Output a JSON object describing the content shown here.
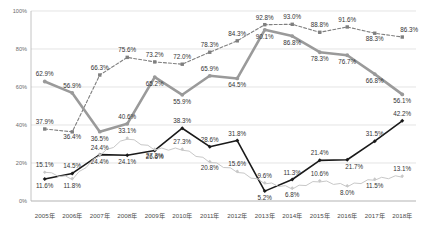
{
  "chart": {
    "title": "",
    "type": "line"
  },
  "axes": {
    "y_ticks": [
      "100%",
      "80%",
      "60%",
      "40%",
      "20%",
      "0%"
    ],
    "y_min": 0,
    "y_max": 100,
    "x_ticks": [
      "2005年",
      "2006年",
      "2007年",
      "2008年",
      "2009年",
      "2010年",
      "2011年",
      "2012年",
      "2013年",
      "2014年",
      "2015年",
      "2016年",
      "2017年",
      "2018年"
    ],
    "grid": true,
    "legend": "none"
  },
  "chart_data": {
    "type": "line",
    "title": "",
    "xlabel": "",
    "ylabel": "",
    "ylim": [
      0,
      100
    ],
    "grid": true,
    "legend_position": "none",
    "categories": [
      "2005年",
      "2006年",
      "2007年",
      "2008年",
      "2009年",
      "2010年",
      "2011年",
      "2012年",
      "2013年",
      "2014年",
      "2015年",
      "2016年",
      "2017年",
      "2018年"
    ],
    "series": [
      {
        "name": "series-gray-dashed",
        "style": "dashed-gray-square",
        "values": [
          37.9,
          36.4,
          66.3,
          75.6,
          73.2,
          72.0,
          78.3,
          84.3,
          92.8,
          93.0,
          88.8,
          91.6,
          88.3,
          86.3
        ],
        "labels": [
          "37.9%",
          "36.4%",
          "66.3%",
          "75.6%",
          "73.2%",
          "72.0%",
          "78.3%",
          "84.3%",
          "92.8%",
          "93.0%",
          "88.8%",
          "91.6%",
          "88.3%",
          "86.3%"
        ]
      },
      {
        "name": "series-gray-solid",
        "style": "solid-gray-thick",
        "values": [
          62.9,
          56.9,
          36.5,
          40.6,
          65.2,
          55.9,
          65.9,
          64.5,
          90.1,
          86.8,
          78.3,
          76.7,
          66.8,
          56.1
        ],
        "labels": [
          "62.9%",
          "56.9%",
          "36.5%",
          "40.6%",
          "65.2%",
          "55.9%",
          "65.9%",
          "64.5%",
          "90.1%",
          "86.8%",
          "78.3%",
          "76.7%",
          "66.8%",
          "56.1%"
        ]
      },
      {
        "name": "series-black-solid",
        "style": "solid-black-diamond",
        "values": [
          11.6,
          14.5,
          24.4,
          24.1,
          26.6,
          38.3,
          28.6,
          31.8,
          5.2,
          11.3,
          21.4,
          21.7,
          31.5,
          42.2
        ],
        "labels": [
          "11.6%",
          "14.5%",
          "24.4%",
          "24.1%",
          "26.6%",
          "38.3%",
          "28.6%",
          "31.8%",
          "5.2%",
          "11.3%",
          "21.4%",
          "21.7%",
          "31.5%",
          "42.2%"
        ]
      },
      {
        "name": "series-light-gray",
        "style": "thin-light-gray-diamond",
        "values": [
          15.1,
          11.8,
          24.4,
          33.1,
          27.3,
          27.3,
          20.8,
          15.6,
          9.6,
          6.8,
          10.6,
          8.0,
          11.5,
          13.1
        ],
        "labels": [
          "15.1%",
          "11.8%",
          "24.4%",
          "33.1%",
          "27.3%",
          "27.3%",
          "20.8%",
          "15.6%",
          "9.6%",
          "6.8%",
          "10.6%",
          "8.0%",
          "11.5%",
          "13.1%"
        ]
      }
    ],
    "point_labels_all": [
      "62.9%",
      "56.9%",
      "66.3%",
      "75.6%",
      "73.2%",
      "72.0%",
      "65.9%",
      "64.5%",
      "92.8%",
      "93.0%",
      "88.8%",
      "91.6%",
      "88.3%",
      "86.3%",
      "90.1%",
      "86.8%",
      "78.3%",
      "76.7%",
      "66.8%",
      "56.1%",
      "84.3%",
      "78.3%",
      "65.2%",
      "55.9%",
      "36.5%",
      "40.6%",
      "36.4%",
      "37.9%",
      "15.1%",
      "14.5%",
      "11.6%",
      "11.8%",
      "24.4%",
      "24.1%",
      "33.1%",
      "27.3%",
      "26.6%",
      "27.3%",
      "38.3%",
      "32.6%",
      "28.6%",
      "20.8%",
      "31.8%",
      "15.6%",
      "9.6%",
      "5.2%",
      "11.3%",
      "6.8%",
      "21.4%",
      "10.6%",
      "21.7%",
      "8.0%",
      "31.5%",
      "11.5%",
      "42.2%",
      "13.1%"
    ]
  },
  "colors": {
    "gray_dashed": "#7f7f7f",
    "gray_solid": "#9a9a9a",
    "black_solid": "#1a1a1a",
    "light_gray": "#c8c8c8",
    "grid": "#d9d9d9",
    "axis": "#b5b5b5",
    "label_text": "#333333",
    "tick_text": "#6b6b6b",
    "background": "#ffffff"
  }
}
